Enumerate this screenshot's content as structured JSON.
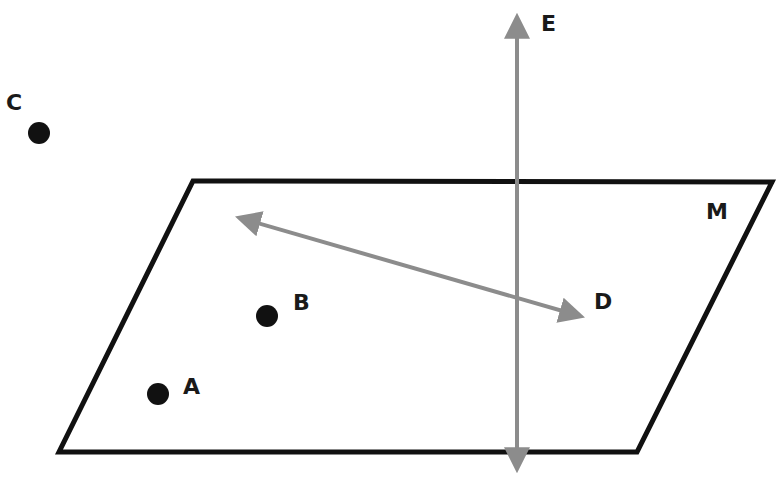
{
  "diagram": {
    "colors": {
      "plane_stroke": "#111111",
      "line_stroke": "#8c8c8c",
      "point_fill": "#111111",
      "label": "#1a1a1a",
      "background": "#ffffff"
    },
    "plane": {
      "label": "M",
      "corners": [
        [
          193,
          181
        ],
        [
          772,
          182
        ],
        [
          637,
          452
        ],
        [
          59,
          452
        ]
      ]
    },
    "points": [
      {
        "name": "A",
        "label": "A",
        "x": 158,
        "y": 394
      },
      {
        "name": "B",
        "label": "B",
        "x": 267,
        "y": 316
      },
      {
        "name": "C",
        "label": "C",
        "x": 39,
        "y": 133
      }
    ],
    "lines": [
      {
        "name": "D",
        "label": "D",
        "from": [
          232,
          216
        ],
        "to": [
          588,
          318
        ],
        "description": "line lying in plane M through the plane"
      },
      {
        "name": "E",
        "label": "E",
        "from": [
          517,
          10
        ],
        "to": [
          517,
          476
        ],
        "description": "vertical line intersecting plane M"
      }
    ]
  }
}
